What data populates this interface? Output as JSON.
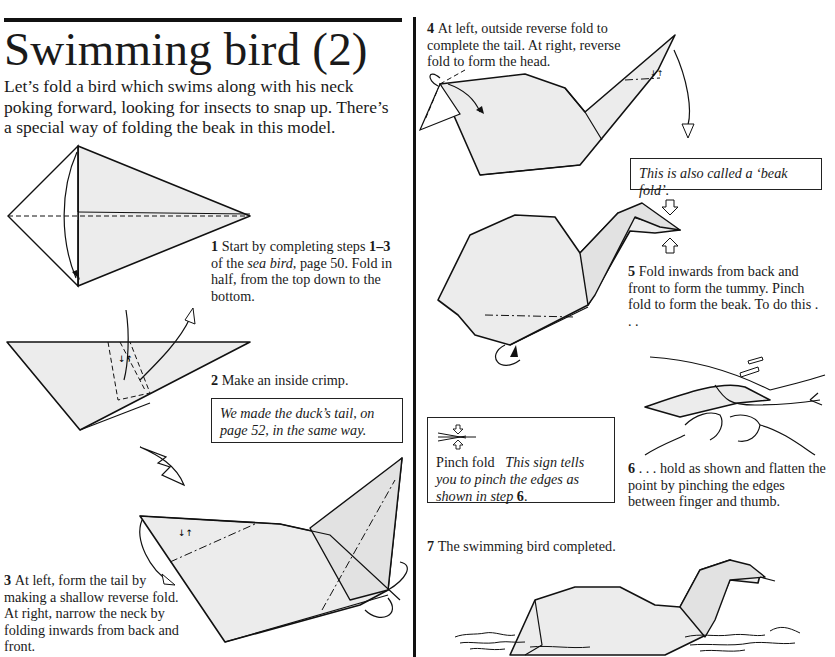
{
  "page": {
    "title": "Swimming bird (2)",
    "intro": "Let’s fold a bird which swims along with his neck poking forward, looking for insects to snap up. There’s a special way of folding the beak in this model."
  },
  "steps": [
    {
      "number": "1",
      "text_parts": [
        "Start by completing steps ",
        "1–3",
        " of the ",
        "sea bird",
        ", page 50. Fold in half, from the top down to the bottom."
      ]
    },
    {
      "number": "2",
      "text": "Make an inside crimp."
    },
    {
      "number": "3",
      "text": "At left, form the tail by making a shallow reverse fold. At right, narrow the neck by folding inwards from back and front."
    },
    {
      "number": "4",
      "text": "At left, outside reverse fold to complete the tail. At right, reverse fold to form the head."
    },
    {
      "number": "5",
      "text": "Fold inwards from back and front to form the tummy. Pinch fold to form the beak. To do this . . ."
    },
    {
      "number": "6",
      "text": ". . . hold as shown and flatten the point by pinching the edges between finger and thumb."
    },
    {
      "number": "7",
      "text": "The swimming bird completed."
    }
  ],
  "notes": {
    "duck_tail": "We made the duck’s tail, on page 52, in the same way.",
    "beak_fold": "This is also called a ‘beak fold’.",
    "pinch_fold": {
      "label": "Pinch fold",
      "text_before": "This sign tells you to pinch the edges as shown in step ",
      "step_ref": "6",
      "text_after": "."
    }
  },
  "icons": {
    "pinch_fold_symbol": "pinch-fold-icon",
    "valley_fold_arrow": "fold-arrow-icon",
    "crimp_symbol": "crimp-icon"
  },
  "colors": {
    "paper": "#ececec",
    "ink": "#111111",
    "background": "#ffffff"
  }
}
